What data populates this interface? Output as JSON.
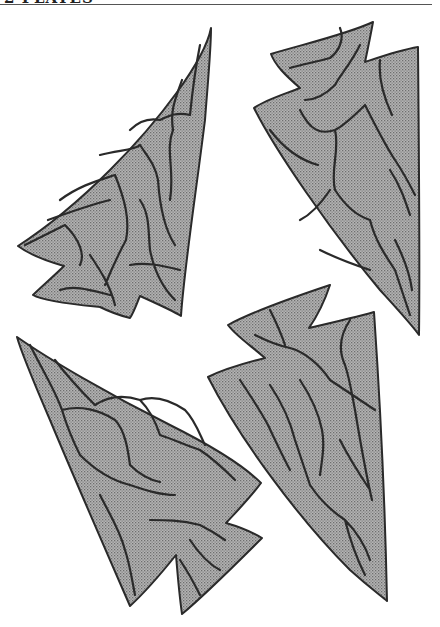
{
  "header": {
    "text": "2 PLATES",
    "note": "text clipped at top edge of image"
  },
  "figure": {
    "fill_color": "#a8a8a8",
    "stroke_color": "#2a2a2a",
    "items": [
      {
        "label": "arrowhead-top-left"
      },
      {
        "label": "arrowhead-top-right"
      },
      {
        "label": "arrowhead-bottom-left"
      },
      {
        "label": "arrowhead-bottom-right"
      }
    ]
  }
}
